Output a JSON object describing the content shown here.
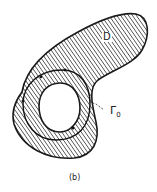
{
  "figure": {
    "region_label": "D",
    "contour_label": "Γ",
    "contour_subscript": "0",
    "caption": "(b)"
  },
  "colors": {
    "stroke": "#1a1a1a",
    "hatch": "#2a2a2a",
    "background": "#ffffff"
  }
}
